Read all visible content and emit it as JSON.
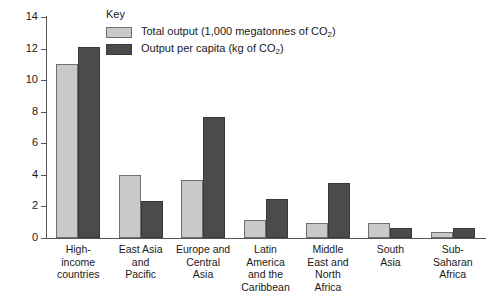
{
  "legend": {
    "title": "Key",
    "entries": [
      {
        "label_pre": "Total output (1,000 megatonnes of CO",
        "label_sub": "2",
        "label_post": ")",
        "color": "#c9c9c9",
        "swatch": "light-swatch"
      },
      {
        "label_pre": "Output per capita (kg of CO",
        "label_sub": "2",
        "label_post": ")",
        "color": "#4b4b4b",
        "swatch": "dark-swatch"
      }
    ]
  },
  "axis": {
    "y_ticks": [
      "0",
      "2",
      "4",
      "6",
      "8",
      "10",
      "12",
      "14"
    ]
  },
  "categories_wrapped": [
    [
      "High-",
      "income",
      "countries"
    ],
    [
      "East Asia",
      "and",
      "Pacific"
    ],
    [
      "Europe and",
      "Central",
      "Asia"
    ],
    [
      "Latin",
      "America",
      "and the",
      "Caribbean"
    ],
    [
      "Middle",
      "East and",
      "North",
      "Africa"
    ],
    [
      "South",
      "Asia"
    ],
    [
      "Sub-",
      "Saharan",
      "Africa"
    ]
  ],
  "chart_data": {
    "type": "bar",
    "title": "",
    "xlabel": "",
    "ylabel": "",
    "ylim": [
      0,
      14
    ],
    "yticks": [
      0,
      2,
      4,
      6,
      8,
      10,
      12,
      14
    ],
    "grid": false,
    "legend_position": "top-center",
    "categories": [
      "High-income countries",
      "East Asia and Pacific",
      "Europe and Central Asia",
      "Latin America and the Caribbean",
      "Middle East and North Africa",
      "South Asia",
      "Sub-Saharan Africa"
    ],
    "series": [
      {
        "name": "Total output (1,000 megatonnes of CO2)",
        "color": "#c9c9c9",
        "values": [
          11.0,
          4.0,
          3.7,
          1.15,
          0.95,
          0.95,
          0.4
        ]
      },
      {
        "name": "Output per capita (kg of CO2)",
        "color": "#4b4b4b",
        "values": [
          12.1,
          2.35,
          7.65,
          2.5,
          3.5,
          0.65,
          0.65
        ]
      }
    ]
  }
}
